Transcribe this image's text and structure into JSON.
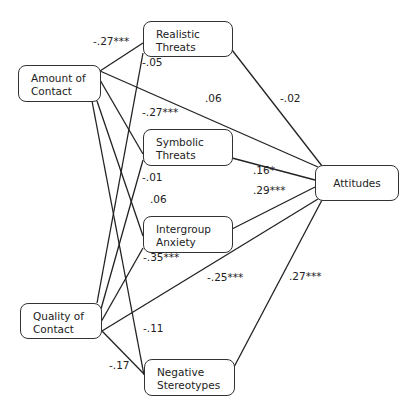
{
  "diagram": {
    "type": "path-model",
    "nodes": [
      {
        "id": "amount",
        "lines": [
          "Amount of",
          "Contact"
        ],
        "x": 18,
        "y": 65,
        "w": 83,
        "h": 37
      },
      {
        "id": "quality",
        "lines": [
          "Quality of",
          "Contact"
        ],
        "x": 20,
        "y": 303,
        "w": 82,
        "h": 36
      },
      {
        "id": "realistic",
        "lines": [
          "Realistic",
          "Threats"
        ],
        "x": 143,
        "y": 21,
        "w": 90,
        "h": 36
      },
      {
        "id": "symbolic",
        "lines": [
          "Symbolic",
          "Threats"
        ],
        "x": 143,
        "y": 129,
        "w": 90,
        "h": 37
      },
      {
        "id": "anxiety",
        "lines": [
          "Intergroup",
          "Anxiety"
        ],
        "x": 143,
        "y": 216,
        "w": 90,
        "h": 37
      },
      {
        "id": "stereotypes",
        "lines": [
          "Negative",
          "Stereotypes"
        ],
        "x": 144,
        "y": 359,
        "w": 91,
        "h": 37
      },
      {
        "id": "attitudes",
        "lines": [
          "Attitudes"
        ],
        "x": 315,
        "y": 165,
        "w": 84,
        "h": 36
      }
    ],
    "edges": [
      {
        "from": "amount",
        "to": "realistic",
        "coef": "-.27***",
        "x1": 100,
        "y1": 71,
        "x2": 143,
        "y2": 43
      },
      {
        "from": "amount",
        "to": "symbolic",
        "coef": "-.27***",
        "x1": 100,
        "y1": 80,
        "x2": 143,
        "y2": 154
      },
      {
        "from": "amount",
        "to": "anxiety",
        "coef": ".06",
        "x1": 97,
        "y1": 101,
        "x2": 143,
        "y2": 236
      },
      {
        "from": "amount",
        "to": "stereotypes",
        "coef": "-.11",
        "x1": 92,
        "y1": 101,
        "x2": 144,
        "y2": 375
      },
      {
        "from": "amount",
        "to": "attitudes",
        "coef": ".06",
        "x1": 100,
        "y1": 71,
        "x2": 318,
        "y2": 167
      },
      {
        "from": "quality",
        "to": "realistic",
        "coef": "-.05",
        "x1": 97,
        "y1": 303,
        "x2": 143,
        "y2": 53
      },
      {
        "from": "quality",
        "to": "symbolic",
        "coef": "-.01",
        "x1": 101,
        "y1": 309,
        "x2": 143,
        "y2": 160
      },
      {
        "from": "quality",
        "to": "anxiety",
        "coef": "-.35***",
        "x1": 101,
        "y1": 322,
        "x2": 143,
        "y2": 248
      },
      {
        "from": "quality",
        "to": "stereotypes",
        "coef": "-.17",
        "x1": 102,
        "y1": 331,
        "x2": 144,
        "y2": 374
      },
      {
        "from": "quality",
        "to": "attitudes",
        "coef": "-.25***",
        "x1": 102,
        "y1": 331,
        "x2": 318,
        "y2": 199
      },
      {
        "from": "realistic",
        "to": "attitudes",
        "coef": "-.02",
        "x1": 232,
        "y1": 50,
        "x2": 322,
        "y2": 166
      },
      {
        "from": "symbolic",
        "to": "attitudes",
        "coef": ".16*",
        "x1": 232,
        "y1": 158,
        "x2": 315,
        "y2": 180
      },
      {
        "from": "anxiety",
        "to": "attitudes",
        "coef": ".29***",
        "x1": 232,
        "y1": 229,
        "x2": 315,
        "y2": 187
      },
      {
        "from": "stereotypes",
        "to": "attitudes",
        "coef": ".27***",
        "x1": 234,
        "y1": 367,
        "x2": 322,
        "y2": 200
      }
    ],
    "labels": [
      {
        "edge": "amount-realistic",
        "text": "-.27***",
        "x": 93,
        "y": 41
      },
      {
        "edge": "quality-realistic",
        "text": "-.05",
        "x": 142,
        "y": 62
      },
      {
        "edge": "amount-attitudes",
        "text": ".06",
        "x": 205,
        "y": 98
      },
      {
        "edge": "realistic-attitudes",
        "text": "-.02",
        "x": 280,
        "y": 98
      },
      {
        "edge": "amount-symbolic",
        "text": "-.27***",
        "x": 142,
        "y": 112
      },
      {
        "edge": "quality-symbolic",
        "text": "-.01",
        "x": 142,
        "y": 177
      },
      {
        "edge": "amount-anxiety",
        "text": ".06",
        "x": 150,
        "y": 199
      },
      {
        "edge": "symbolic-attitudes",
        "text": ".16*",
        "x": 253,
        "y": 170
      },
      {
        "edge": "anxiety-attitudes",
        "text": ".29***",
        "x": 253,
        "y": 190
      },
      {
        "edge": "quality-anxiety",
        "text": "-.35***",
        "x": 143,
        "y": 257
      },
      {
        "edge": "quality-attitudes",
        "text": "-.25***",
        "x": 207,
        "y": 277
      },
      {
        "edge": "stereotypes-attitudes",
        "text": ".27***",
        "x": 289,
        "y": 276
      },
      {
        "edge": "amount-stereotypes",
        "text": "-.11",
        "x": 143,
        "y": 328
      },
      {
        "edge": "quality-stereotypes",
        "text": "-.17",
        "x": 109,
        "y": 365
      }
    ]
  }
}
